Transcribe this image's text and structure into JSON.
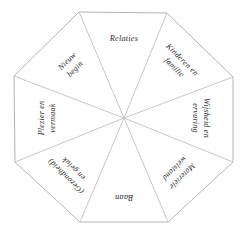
{
  "diagram": {
    "type": "octagon-life-wheel",
    "shape": "octagon",
    "segment_count": 8,
    "background_color": "#ffffff",
    "outline_color": "#b4b4b4",
    "spoke_color": "#c0c0c0",
    "text_color": "#2b2b2b",
    "center": {
      "x": 124,
      "y": 118
    },
    "vertices": [
      {
        "x": 79,
        "y": 12
      },
      {
        "x": 167,
        "y": 13
      },
      {
        "x": 233,
        "y": 77
      },
      {
        "x": 233,
        "y": 162
      },
      {
        "x": 168,
        "y": 222
      },
      {
        "x": 80,
        "y": 222
      },
      {
        "x": 15,
        "y": 162
      },
      {
        "x": 14,
        "y": 76
      }
    ],
    "segments": [
      {
        "id": "relaties",
        "position": "top",
        "label": "Relaties",
        "lines": [
          "Relaties"
        ],
        "rotation_deg": 0
      },
      {
        "id": "kinderen-en-familie",
        "position": "top-right",
        "label": "Kinderen en familie",
        "lines": [
          "Kinderen en",
          "familie"
        ],
        "rotation_deg": 45
      },
      {
        "id": "wijsheid-en-ervaring",
        "position": "right",
        "label": "Wijsheid en ervaring",
        "lines": [
          "Wijsheid en",
          "ervaring"
        ],
        "rotation_deg": 90
      },
      {
        "id": "materiele-welstand",
        "position": "bottom-right",
        "label": "Materiële welstand",
        "lines": [
          "Materiële",
          "welstand"
        ],
        "rotation_deg": 135
      },
      {
        "id": "baan",
        "position": "bottom",
        "label": "Baan",
        "lines": [
          "Baan"
        ],
        "rotation_deg": 180
      },
      {
        "id": "gezondheid-en-geluk",
        "position": "bottom-left",
        "label": "(Gezondheid) en geluk",
        "lines": [
          "(Gezondheid)",
          "en geluk"
        ],
        "rotation_deg": 225
      },
      {
        "id": "plezier-en-vermaak",
        "position": "left",
        "label": "Plezier en vermaak",
        "lines": [
          "Plezier en",
          "vermaak"
        ],
        "rotation_deg": 270
      },
      {
        "id": "nieuw-begin",
        "position": "top-left",
        "label": "Nieuw begin",
        "lines": [
          "Nieuw",
          "begin"
        ],
        "rotation_deg": 315
      }
    ]
  }
}
